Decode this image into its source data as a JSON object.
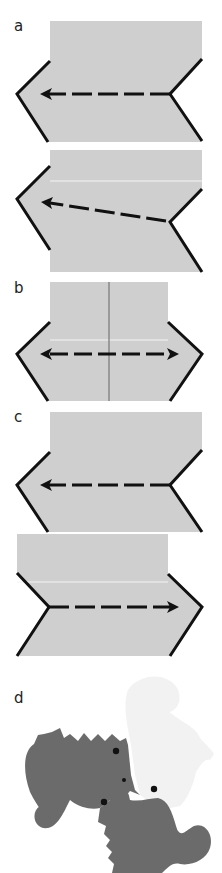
{
  "panels": [
    {
      "id": "a",
      "label": "a"
    },
    {
      "id": "b",
      "label": "b"
    },
    {
      "id": "c",
      "label": "c"
    },
    {
      "id": "d",
      "label": "d"
    }
  ],
  "colors": {
    "paper": "#cfcfcf",
    "edge": "#111111",
    "seahorse_dark": "#6b6b6b",
    "seahorse_light": "#f2f2f2",
    "crease": "#888888"
  }
}
